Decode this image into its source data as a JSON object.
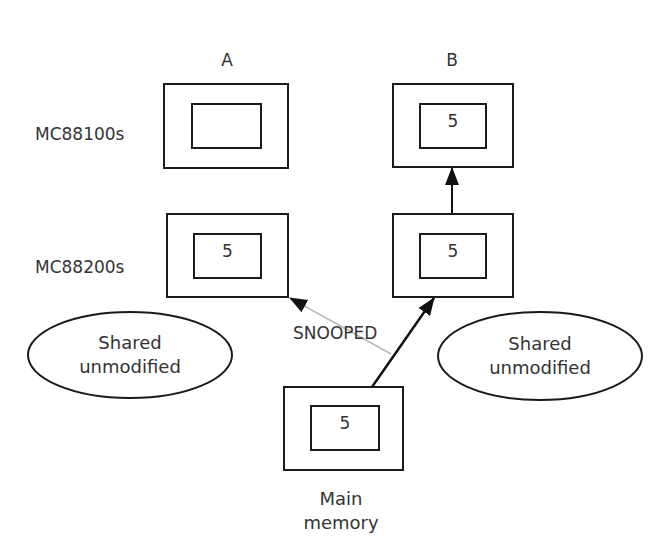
{
  "columns": {
    "a_label": "A",
    "b_label": "B"
  },
  "rows": {
    "processor_label": "MC88100s",
    "cache_label": "MC88200s"
  },
  "boxes": {
    "a_processor_value": "",
    "b_processor_value": "5",
    "a_cache_value": "5",
    "b_cache_value": "5",
    "memory_value": "5"
  },
  "states": {
    "left": {
      "line1": "Shared",
      "line2": "unmodified"
    },
    "right": {
      "line1": "Shared",
      "line2": "unmodified"
    }
  },
  "arrows": {
    "snoop_label": "SNOOPED",
    "snoop_color": "#bdbdbd",
    "data_color": "#111111"
  },
  "memory": {
    "line1": "Main",
    "line2": "memory"
  }
}
